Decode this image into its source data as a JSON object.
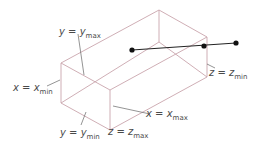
{
  "diagram": {
    "colors": {
      "box_edge": "#c9a5ad",
      "leader_line": "#555555",
      "segment": "#222222",
      "point": "#111111",
      "text": "#4a4a4a"
    },
    "box": {
      "vertices": {
        "front_top_left": [
          61,
          63
        ],
        "front_bottom_left": [
          61,
          103
        ],
        "front_top_right": [
          110,
          90
        ],
        "front_bottom_right": [
          110,
          130
        ],
        "back_top_left": [
          159,
          10
        ],
        "back_bottom_left": [
          159,
          42
        ],
        "back_top_right": [
          207,
          37
        ],
        "back_bottom_right": [
          207,
          77
        ]
      }
    },
    "segment": {
      "points": [
        {
          "name": "inside-point",
          "x": 132,
          "y": 50
        },
        {
          "name": "intersection-point",
          "x": 204,
          "y": 46
        },
        {
          "name": "outside-point",
          "x": 236,
          "y": 43
        }
      ]
    },
    "labels": [
      {
        "id": "y-max",
        "var": "y",
        "eq": " = ",
        "rhs": "y",
        "sub": "max"
      },
      {
        "id": "x-min",
        "var": "x",
        "eq": " = ",
        "rhs": "x",
        "sub": "min"
      },
      {
        "id": "y-min",
        "var": "y",
        "eq": " = ",
        "rhs": "y",
        "sub": "min"
      },
      {
        "id": "z-max",
        "var": "z",
        "eq": " = ",
        "rhs": "z",
        "sub": "max"
      },
      {
        "id": "x-max",
        "var": "x",
        "eq": " = ",
        "rhs": "x",
        "sub": "max"
      },
      {
        "id": "z-min",
        "var": "z",
        "eq": " = ",
        "rhs": "z",
        "sub": "min"
      }
    ]
  }
}
